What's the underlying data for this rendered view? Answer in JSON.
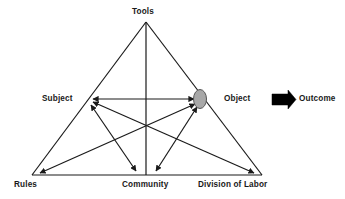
{
  "diagram": {
    "type": "activity-system-model",
    "background_color": "#ffffff",
    "line_color": "#1a1a1a",
    "text_color": "#1a1a1a",
    "object_marker_fill": "#a8a8a8",
    "object_marker_stroke": "#555555",
    "outcome_arrow_color": "#000000",
    "nodes": {
      "tools": "Tools",
      "subject": "Subject",
      "object": "Object",
      "rules": "Rules",
      "community": "Community",
      "division_of_labor": "Division of Labor",
      "outcome": "Outcome"
    }
  }
}
